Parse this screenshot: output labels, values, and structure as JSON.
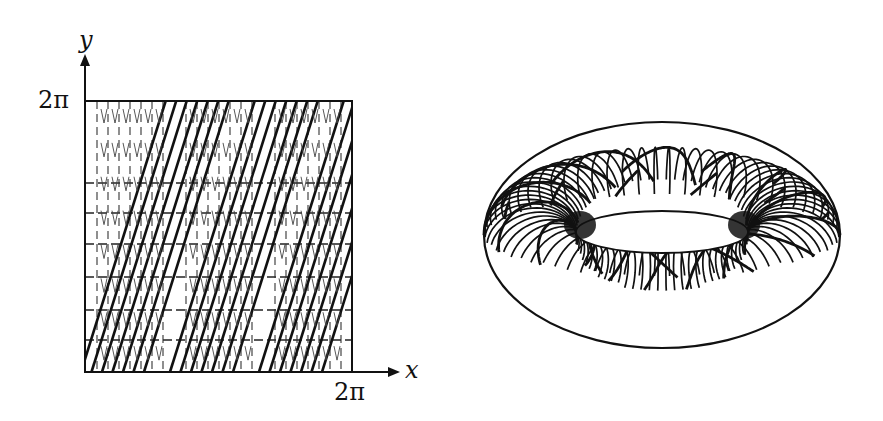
{
  "figure": {
    "left_panel": {
      "title": "Square representation of the torus flow",
      "x_axis_label": "x",
      "y_axis_label": "y",
      "x_tick_label": "2π",
      "y_tick_label": "2π",
      "square": {
        "x0": 85,
        "y0": 101,
        "x1": 352,
        "y1": 372
      },
      "trajectory_slope": 3.2,
      "trajectory_groups": 3,
      "lines_per_group": 7,
      "horizontal_dashed_y": [
        183,
        213,
        244,
        277,
        310,
        340
      ],
      "line_color": "#111111"
    },
    "right_panel": {
      "title": "Trajectory winding on a torus",
      "torus": {
        "cx": 662,
        "cy": 235,
        "rx_outer": 178,
        "ry_outer": 113,
        "rx_inner": 86,
        "ry_inner": 21
      },
      "meridian_count": 70,
      "helix_count": 14,
      "line_color": "#111111"
    }
  }
}
